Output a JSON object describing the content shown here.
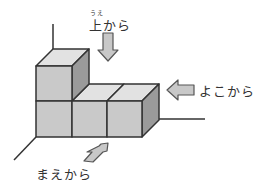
{
  "labels": {
    "top_ruby": "うえ",
    "top": "上から",
    "side": "よこから",
    "front": "まえから"
  },
  "colors": {
    "front_face": "#c9c9c9",
    "top_face": "#e2e2e2",
    "side_face": "#9a9a9a",
    "outline": "#333333",
    "arrow_fill": "#c8c8c8"
  }
}
